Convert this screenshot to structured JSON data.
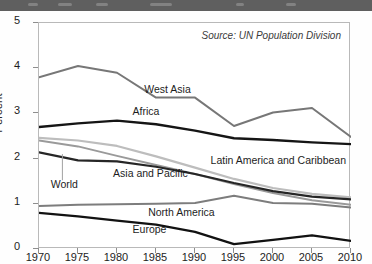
{
  "header": {
    "strip_color": "#5f5f5f"
  },
  "chart_data": {
    "type": "line",
    "title": "",
    "subtitle": "",
    "xlabel": "",
    "ylabel": "Percent",
    "annotation": "Source: UN Population Division",
    "x": [
      1970,
      1975,
      1980,
      1985,
      1990,
      1995,
      2000,
      2005,
      2010
    ],
    "xtick_labels": [
      "1970",
      "1975",
      "1980",
      "1985",
      "1990",
      "1995",
      "2000",
      "2005",
      "2010"
    ],
    "ytick_labels": [
      "0",
      "1",
      "2",
      "3",
      "4",
      "5"
    ],
    "ytick_values": [
      0,
      1,
      2,
      3,
      4,
      5
    ],
    "xlim": [
      1970,
      2010
    ],
    "ylim": [
      0,
      5
    ],
    "grid": false,
    "legend": "inline-labels",
    "series": [
      {
        "name": "West Asia",
        "color": "#777777",
        "width": 2.0,
        "values": [
          3.8,
          4.05,
          3.9,
          3.35,
          3.35,
          2.72,
          3.02,
          3.12,
          2.48
        ],
        "label_x": 1983.5,
        "label_y": 3.52
      },
      {
        "name": "Africa",
        "color": "#151515",
        "width": 2.4,
        "values": [
          2.7,
          2.78,
          2.84,
          2.76,
          2.62,
          2.45,
          2.41,
          2.36,
          2.32
        ],
        "label_x": 1982.0,
        "label_y": 3.02
      },
      {
        "name": "Latin America and Caribbean",
        "color": "#bdbdbd",
        "width": 2.2,
        "values": [
          2.46,
          2.4,
          2.28,
          2.05,
          1.8,
          1.55,
          1.35,
          1.22,
          1.14
        ],
        "label_x": 1992.0,
        "label_y": 1.94
      },
      {
        "name": "Asia and Pacific",
        "color": "#9a9a9a",
        "width": 2.0,
        "values": [
          2.4,
          2.27,
          2.06,
          1.86,
          1.66,
          1.44,
          1.24,
          1.08,
          0.98
        ],
        "label_x": 1979.5,
        "label_y": 1.66
      },
      {
        "name": "World",
        "color": "#262626",
        "width": 2.2,
        "values": [
          2.14,
          1.96,
          1.94,
          1.82,
          1.66,
          1.46,
          1.28,
          1.16,
          1.1
        ],
        "label_x": 1971.5,
        "label_y": 1.42
      },
      {
        "name": "North America",
        "color": "#7d7d7d",
        "width": 2.0,
        "values": [
          0.95,
          0.98,
          0.99,
          1.0,
          1.02,
          1.18,
          1.02,
          1.0,
          0.92
        ],
        "label_x": 1984.0,
        "label_y": 0.8
      },
      {
        "name": "Europe",
        "color": "#121212",
        "width": 2.3,
        "values": [
          0.8,
          0.72,
          0.63,
          0.54,
          0.38,
          0.11,
          0.2,
          0.3,
          0.18
        ],
        "label_x": 1982.0,
        "label_y": 0.42
      }
    ],
    "leader_lines": [
      {
        "for": "World",
        "x": 1973.0,
        "y_top": 2.1,
        "y_bottom": 1.52
      }
    ]
  }
}
